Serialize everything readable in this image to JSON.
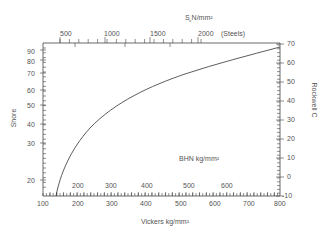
{
  "chart_data": {
    "type": "line",
    "xlabel": "Vickers kg/mm²",
    "ylabel": "Shore",
    "y2label": "Rockwell C",
    "top_axis_label": "S_u N/mm²",
    "top_axis_note": "(Steels)",
    "inner_axis_label": "BHN  kg/mm²",
    "xlim": [
      100,
      800
    ],
    "x_ticks": [
      100,
      200,
      300,
      400,
      500,
      600,
      700,
      800
    ],
    "y_ticks_left": [
      20,
      30,
      40,
      50,
      60,
      70,
      80,
      90
    ],
    "y_ticks_right": [
      -10,
      0,
      10,
      20,
      30,
      40,
      50,
      60,
      70
    ],
    "top_ticks": [
      500,
      1000,
      1500,
      2000
    ],
    "bhn_ticks": [
      200,
      300,
      400,
      500,
      600
    ],
    "grid": false,
    "series": [
      {
        "name": "Hardness curve",
        "x": [
          140,
          150,
          175,
          200,
          250,
          300,
          350,
          400,
          450,
          500,
          550,
          600,
          650,
          700,
          750,
          800
        ],
        "y_shore": [
          18,
          22,
          26.5,
          30,
          36,
          42,
          47.5,
          52.5,
          57,
          61,
          65,
          70,
          74,
          80,
          85,
          91
        ],
        "y_rockwell_c": [
          -10,
          -5,
          0,
          5,
          13,
          20,
          27,
          33,
          38,
          43,
          48,
          52,
          56,
          60,
          64,
          67
        ]
      }
    ]
  },
  "labels": {
    "top_axis": "S  N/mm²",
    "top_sub": "u",
    "steels": "(Steels)",
    "bhn": "BHN  kg/mm²",
    "shore": "Shore",
    "rockwell": "Rockwell C",
    "vickers": "Vickers kg/mm²"
  },
  "top_tick_labels": [
    "500",
    "1000",
    "1500",
    "2000"
  ],
  "bottom_tick_labels": [
    "100",
    "200",
    "300",
    "400",
    "500",
    "600",
    "700",
    "800"
  ],
  "bhn_tick_labels": [
    "200",
    "300",
    "400",
    "500",
    "600"
  ],
  "left_tick_labels": [
    "90",
    "80",
    "70",
    "60",
    "50",
    "40",
    "30",
    "20"
  ],
  "right_tick_labels": [
    "70",
    "60",
    "50",
    "40",
    "30",
    "20",
    "10",
    "0",
    "-10"
  ]
}
